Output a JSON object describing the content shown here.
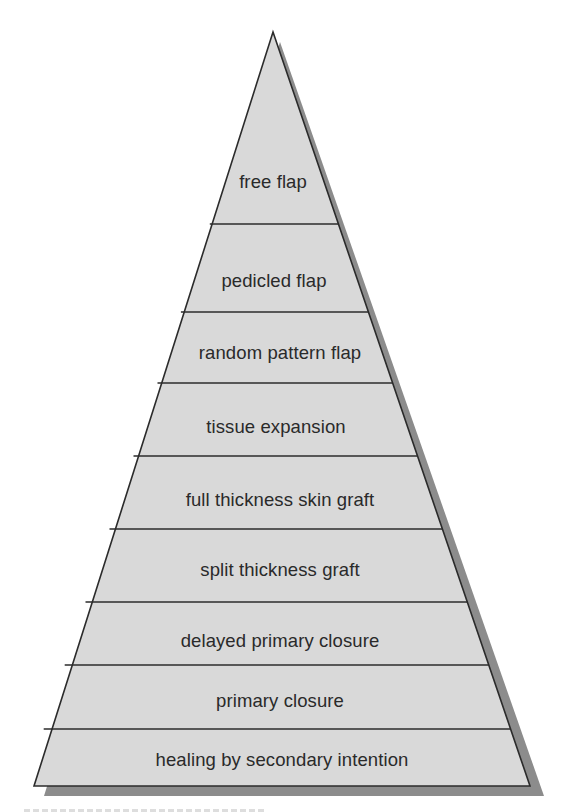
{
  "diagram": {
    "type": "pyramid",
    "colors": {
      "fill": "#d9d9d9",
      "outline": "#2b2b2b",
      "shadow": "#8c8c8c",
      "text": "#2a2a2a",
      "background": "#ffffff"
    },
    "layers_top_to_bottom": [
      {
        "label": "free flap"
      },
      {
        "label": "pedicled flap"
      },
      {
        "label": "random pattern flap"
      },
      {
        "label": "tissue expansion"
      },
      {
        "label": "full thickness skin graft"
      },
      {
        "label": "split thickness graft"
      },
      {
        "label": "delayed primary closure"
      },
      {
        "label": "primary closure"
      },
      {
        "label": "healing by secondary intention"
      }
    ]
  }
}
